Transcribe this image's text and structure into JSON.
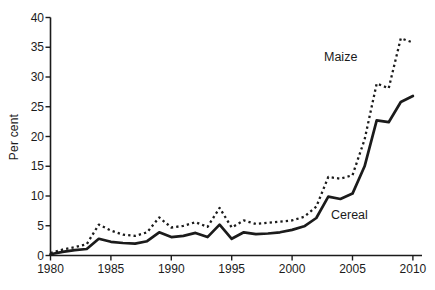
{
  "chart_data": {
    "type": "line",
    "title": "",
    "xlabel": "",
    "ylabel": "Per cent",
    "ylim": [
      0,
      40
    ],
    "ytick_step": 5,
    "yticks": [
      0,
      5,
      10,
      15,
      20,
      25,
      30,
      35,
      40
    ],
    "xticks": [
      1980,
      1985,
      1990,
      1995,
      2000,
      2005,
      2010
    ],
    "grid": "off",
    "legend_position": "inline-annotations",
    "background": "#ffffff",
    "line_color": "#1b1b1b",
    "x": [
      1980,
      1981,
      1982,
      1983,
      1984,
      1985,
      1986,
      1987,
      1988,
      1989,
      1990,
      1991,
      1992,
      1993,
      1994,
      1995,
      1996,
      1997,
      1998,
      1999,
      2000,
      2001,
      2002,
      2003,
      2004,
      2005,
      2006,
      2007,
      2008,
      2009,
      2010
    ],
    "series": [
      {
        "name": "Maize",
        "style": "dotted",
        "values": [
          0.4,
          1.0,
          1.4,
          1.9,
          5.2,
          4.2,
          3.5,
          3.3,
          3.9,
          6.4,
          4.7,
          5.0,
          5.6,
          4.8,
          8.0,
          4.7,
          5.9,
          5.3,
          5.5,
          5.7,
          5.9,
          6.5,
          8.2,
          13.2,
          12.9,
          13.5,
          19.5,
          28.9,
          28.1,
          36.5,
          35.8
        ]
      },
      {
        "name": "Cereal",
        "style": "solid",
        "values": [
          0.2,
          0.6,
          0.9,
          1.1,
          2.8,
          2.3,
          2.1,
          2.0,
          2.4,
          3.9,
          3.1,
          3.3,
          3.8,
          3.1,
          5.2,
          2.8,
          3.9,
          3.6,
          3.7,
          3.9,
          4.3,
          4.9,
          6.3,
          9.9,
          9.5,
          10.4,
          15.0,
          22.7,
          22.4,
          25.8,
          26.8
        ]
      }
    ]
  }
}
